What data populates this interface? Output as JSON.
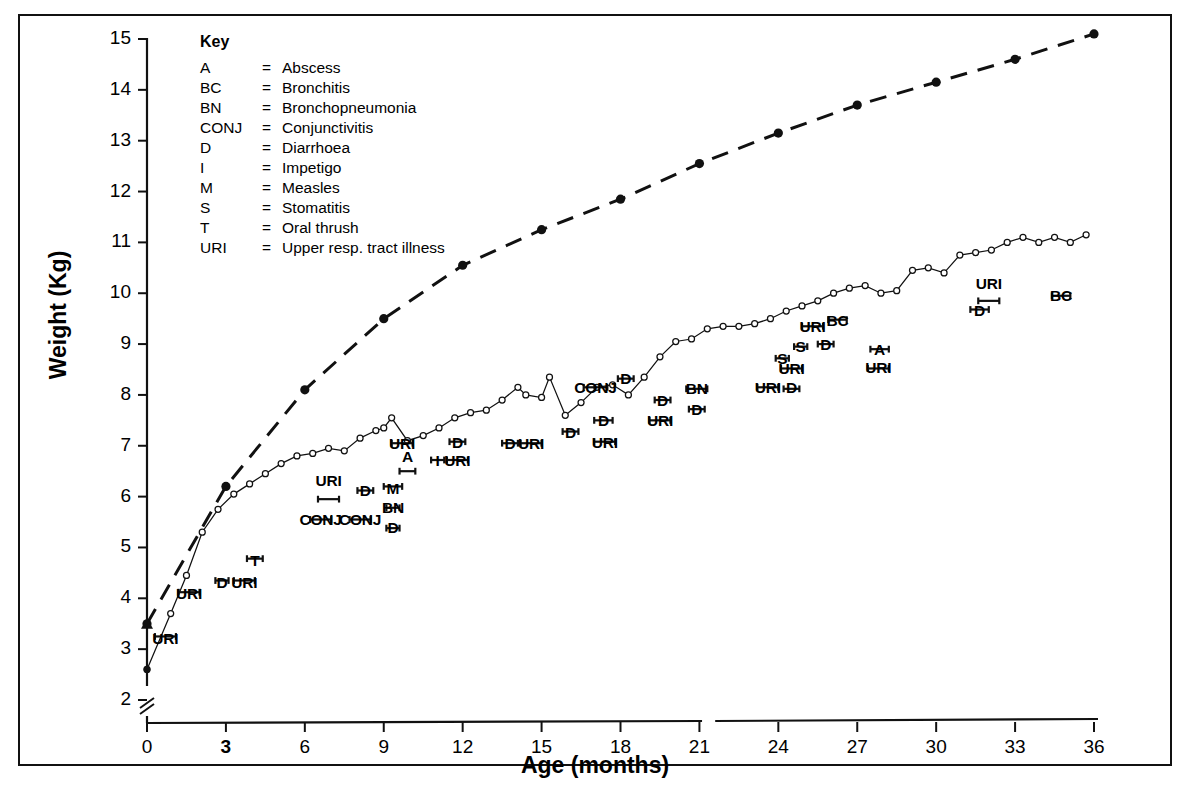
{
  "chart_data": {
    "type": "line",
    "title": "",
    "xlabel": "Age (months)",
    "ylabel": "Weight (Kg)",
    "xlim": [
      0,
      36
    ],
    "ylim": [
      2,
      15
    ],
    "y_axis_break_below": 2,
    "xticks": [
      0,
      3,
      6,
      9,
      12,
      15,
      18,
      21,
      24,
      27,
      30,
      33,
      36
    ],
    "yticks": [
      2,
      3,
      4,
      5,
      6,
      7,
      8,
      9,
      10,
      11,
      12,
      13,
      14,
      15
    ],
    "grid": false,
    "legend_position": "none",
    "series": [
      {
        "name": "reference-standard",
        "style": "dashed",
        "marker": "filled-circle",
        "x": [
          0,
          3,
          6,
          9,
          12,
          15,
          18,
          21,
          24,
          27,
          30,
          33,
          36
        ],
        "values": [
          3.5,
          6.2,
          8.1,
          9.5,
          10.55,
          11.25,
          11.85,
          12.55,
          13.15,
          13.7,
          14.15,
          14.6,
          15.1
        ]
      },
      {
        "name": "child-weight",
        "style": "solid",
        "marker": "open-circle",
        "x": [
          0,
          0.9,
          1.5,
          2.1,
          2.7,
          3.3,
          3.9,
          4.5,
          5.1,
          5.7,
          6.3,
          6.9,
          7.5,
          8.1,
          8.7,
          9.0,
          9.3,
          9.9,
          10.5,
          11.1,
          11.7,
          12.3,
          12.9,
          13.5,
          14.1,
          14.4,
          15.0,
          15.3,
          15.9,
          16.5,
          17.1,
          17.7,
          18.3,
          18.9,
          19.5,
          20.1,
          20.7,
          21.3,
          21.9,
          22.5,
          23.1,
          23.7,
          24.3,
          24.9,
          25.5,
          26.1,
          26.7,
          27.3,
          27.9,
          28.5,
          29.1,
          29.7,
          30.3,
          30.9,
          31.5,
          32.1,
          32.7,
          33.3,
          33.9,
          34.5,
          35.1,
          35.7
        ],
        "values": [
          2.6,
          3.7,
          4.45,
          5.3,
          5.75,
          6.05,
          6.25,
          6.45,
          6.65,
          6.8,
          6.85,
          6.95,
          6.9,
          7.15,
          7.3,
          7.35,
          7.55,
          7.1,
          7.2,
          7.35,
          7.55,
          7.65,
          7.7,
          7.9,
          8.15,
          8.0,
          7.95,
          8.35,
          7.6,
          7.85,
          8.15,
          8.2,
          8.0,
          8.35,
          8.75,
          9.05,
          9.1,
          9.3,
          9.35,
          9.35,
          9.4,
          9.5,
          9.65,
          9.75,
          9.85,
          10.0,
          10.1,
          10.15,
          10.0,
          10.05,
          10.45,
          10.5,
          10.4,
          10.75,
          10.8,
          10.85,
          11.0,
          11.1,
          11.0,
          11.1,
          11.0,
          11.15
        ]
      }
    ],
    "annotations": [
      {
        "label": "URI",
        "age_start": 0.3,
        "age_end": 1.1,
        "bar_y": 3.25,
        "text_y": 3.05
      },
      {
        "label": "URI",
        "age_start": 1.2,
        "age_end": 2.0,
        "bar_y": 4.12,
        "text_y": 3.92
      },
      {
        "label": "D",
        "age_start": 2.6,
        "age_end": 3.1,
        "bar_y": 4.35,
        "text_y": 4.15
      },
      {
        "label": "URI",
        "age_start": 3.3,
        "age_end": 4.1,
        "bar_y": 4.35,
        "text_y": 4.15
      },
      {
        "label": "T",
        "age_start": 3.8,
        "age_end": 4.4,
        "bar_y": 4.78,
        "text_y": 4.58
      },
      {
        "label": "URI",
        "age_start": 6.5,
        "age_end": 7.3,
        "bar_y": 5.95,
        "text_y": 6.15
      },
      {
        "label": "CONJ",
        "age_start": 6.2,
        "age_end": 7.0,
        "bar_y": 5.55,
        "text_y": 5.38
      },
      {
        "label": "D",
        "age_start": 8.0,
        "age_end": 8.6,
        "bar_y": 6.12,
        "text_y": 5.95
      },
      {
        "label": "CONJ",
        "age_start": 7.7,
        "age_end": 8.5,
        "bar_y": 5.55,
        "text_y": 5.38
      },
      {
        "label": "M",
        "age_start": 9.0,
        "age_end": 9.7,
        "bar_y": 6.2,
        "text_y": 6.0
      },
      {
        "label": "BN",
        "age_start": 9.1,
        "age_end": 9.6,
        "bar_y": 5.78,
        "text_y": 5.62
      },
      {
        "label": "D",
        "age_start": 9.1,
        "age_end": 9.6,
        "bar_y": 5.38,
        "text_y": 5.22
      },
      {
        "label": "URI",
        "age_start": 9.3,
        "age_end": 10.1,
        "bar_y": 7.05,
        "text_y": 6.88
      },
      {
        "label": "A",
        "age_start": 9.6,
        "age_end": 10.2,
        "bar_y": 6.5,
        "text_y": 6.62
      },
      {
        "label": "I",
        "age_start": 10.8,
        "age_end": 11.3,
        "bar_y": 6.72,
        "text_y": 6.55
      },
      {
        "label": "D",
        "age_start": 11.5,
        "age_end": 12.1,
        "bar_y": 7.08,
        "text_y": 6.9
      },
      {
        "label": "URI",
        "age_start": 11.4,
        "age_end": 12.2,
        "bar_y": 6.72,
        "text_y": 6.55
      },
      {
        "label": "D",
        "age_start": 13.5,
        "age_end": 14.1,
        "bar_y": 7.05,
        "text_y": 6.88
      },
      {
        "label": "URI",
        "age_start": 14.2,
        "age_end": 15.0,
        "bar_y": 7.05,
        "text_y": 6.88
      },
      {
        "label": "D",
        "age_start": 15.8,
        "age_end": 16.4,
        "bar_y": 7.28,
        "text_y": 7.1
      },
      {
        "label": "CONJ",
        "age_start": 16.6,
        "age_end": 17.5,
        "bar_y": 8.15,
        "text_y": 7.98
      },
      {
        "label": "D",
        "age_start": 17.0,
        "age_end": 17.7,
        "bar_y": 7.5,
        "text_y": 7.32
      },
      {
        "label": "URI",
        "age_start": 17.0,
        "age_end": 17.8,
        "bar_y": 7.08,
        "text_y": 6.9
      },
      {
        "label": "D",
        "age_start": 17.9,
        "age_end": 18.5,
        "bar_y": 8.32,
        "text_y": 8.15
      },
      {
        "label": "D",
        "age_start": 19.3,
        "age_end": 19.9,
        "bar_y": 7.9,
        "text_y": 7.72
      },
      {
        "label": "URI",
        "age_start": 19.1,
        "age_end": 19.9,
        "bar_y": 7.5,
        "text_y": 7.32
      },
      {
        "label": "BN",
        "age_start": 20.5,
        "age_end": 21.3,
        "bar_y": 8.12,
        "text_y": 7.95
      },
      {
        "label": "D",
        "age_start": 20.6,
        "age_end": 21.2,
        "bar_y": 7.72,
        "text_y": 7.55
      },
      {
        "label": "URI",
        "age_start": 23.2,
        "age_end": 24.0,
        "bar_y": 8.15,
        "text_y": 7.98
      },
      {
        "label": "S",
        "age_start": 23.9,
        "age_end": 24.4,
        "bar_y": 8.72,
        "text_y": 8.55
      },
      {
        "label": "URI",
        "age_start": 24.1,
        "age_end": 24.9,
        "bar_y": 8.52,
        "text_y": 8.35
      },
      {
        "label": "D",
        "age_start": 24.2,
        "age_end": 24.8,
        "bar_y": 8.12,
        "text_y": 7.98
      },
      {
        "label": "S",
        "age_start": 24.6,
        "age_end": 25.1,
        "bar_y": 8.95,
        "text_y": 8.78
      },
      {
        "label": "URI",
        "age_start": 24.9,
        "age_end": 25.7,
        "bar_y": 9.35,
        "text_y": 9.18
      },
      {
        "label": "D",
        "age_start": 25.5,
        "age_end": 26.1,
        "bar_y": 9.0,
        "text_y": 8.82
      },
      {
        "label": "BC",
        "age_start": 25.9,
        "age_end": 26.6,
        "bar_y": 9.48,
        "text_y": 9.3
      },
      {
        "label": "A",
        "age_start": 27.5,
        "age_end": 28.2,
        "bar_y": 8.9,
        "text_y": 8.72
      },
      {
        "label": "URI",
        "age_start": 27.4,
        "age_end": 28.2,
        "bar_y": 8.52,
        "text_y": 8.38
      },
      {
        "label": "URI",
        "age_start": 31.6,
        "age_end": 32.4,
        "bar_y": 9.85,
        "text_y": 10.02
      },
      {
        "label": "D",
        "age_start": 31.3,
        "age_end": 32.0,
        "bar_y": 9.68,
        "text_y": 9.5
      },
      {
        "label": "BC",
        "age_start": 34.4,
        "age_end": 35.1,
        "bar_y": 9.95,
        "text_y": 9.78
      }
    ]
  },
  "key": {
    "title": "Key",
    "eq": "=",
    "entries": [
      {
        "abbr": "A",
        "desc": "Abscess"
      },
      {
        "abbr": "BC",
        "desc": "Bronchitis"
      },
      {
        "abbr": "BN",
        "desc": "Bronchopneumonia"
      },
      {
        "abbr": "CONJ",
        "desc": "Conjunctivitis"
      },
      {
        "abbr": "D",
        "desc": "Diarrhoea"
      },
      {
        "abbr": "I",
        "desc": "Impetigo"
      },
      {
        "abbr": "M",
        "desc": "Measles"
      },
      {
        "abbr": "S",
        "desc": "Stomatitis"
      },
      {
        "abbr": "T",
        "desc": "Oral thrush"
      },
      {
        "abbr": "URI",
        "desc": "Upper resp. tract illness"
      }
    ]
  },
  "colors": {
    "ink": "#111111",
    "line": "#222222",
    "background": "#ffffff"
  }
}
